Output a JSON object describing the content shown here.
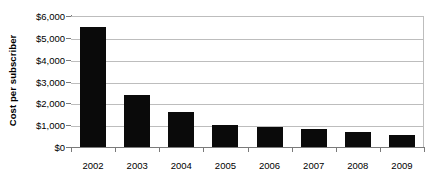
{
  "chart_data": {
    "type": "bar",
    "title": "",
    "subtitle": "",
    "xlabel": "",
    "ylabel": "Cost per subscriber",
    "categories": [
      "2002",
      "2003",
      "2004",
      "2005",
      "2006",
      "2007",
      "2008",
      "2009"
    ],
    "values": [
      5500,
      2400,
      1620,
      1020,
      900,
      830,
      680,
      560
    ],
    "series": [
      {
        "name": "Cost per subscriber",
        "values": [
          5500,
          2400,
          1620,
          1020,
          900,
          830,
          680,
          560
        ]
      }
    ],
    "ylim": [
      0,
      6000
    ],
    "ytick_values": [
      0,
      1000,
      2000,
      3000,
      4000,
      5000,
      6000
    ],
    "ytick_labels": [
      "$0",
      "$1,000",
      "$2,000",
      "$3,000",
      "$4,000",
      "$5,000",
      "$6,000"
    ],
    "xtick_labels": [
      "2002",
      "2003",
      "2004",
      "2005",
      "2006",
      "2007",
      "2008",
      "2009"
    ],
    "grid": true,
    "grid_axis": "y",
    "legend": false,
    "legend_position": "none",
    "bar_color": "#0a0a0a",
    "gridline_color": "#bdbdbd",
    "axis_color": "#7a7a7a",
    "background_color": "#ffffff",
    "annotations": []
  }
}
